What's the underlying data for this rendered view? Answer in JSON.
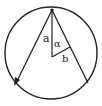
{
  "diagram": {
    "labels": {
      "a": "a",
      "alpha": "α",
      "b": "b"
    },
    "colors": {
      "stroke": "#222222",
      "background": "#ffffff"
    },
    "geometry": {
      "circle": {
        "cx": 51,
        "cy": 53,
        "r": 47
      },
      "top_point": [
        51,
        9
      ],
      "left_chord_end": [
        16,
        82
      ],
      "right_chord_end": [
        87,
        83
      ],
      "center": [
        51,
        56
      ],
      "perp_foot": [
        68,
        47
      ]
    }
  }
}
